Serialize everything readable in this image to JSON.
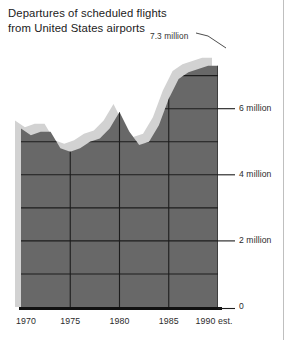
{
  "title": {
    "line1": "Departures of scheduled flights",
    "line2": "from United States airports"
  },
  "annotation": {
    "peak_label": "7.3 million"
  },
  "axes": {
    "y_ticks": [
      {
        "value": 0,
        "label": "0"
      },
      {
        "value": 2,
        "label": "2 million"
      },
      {
        "value": 4,
        "label": "4 million"
      },
      {
        "value": 6,
        "label": "6 million"
      }
    ],
    "x_ticks": [
      {
        "value": 1970,
        "label": "1970"
      },
      {
        "value": 1975,
        "label": "1975"
      },
      {
        "value": 1980,
        "label": "1980"
      },
      {
        "value": 1985,
        "label": "1985"
      },
      {
        "value": 1990,
        "label": "1990 est."
      }
    ]
  },
  "colors": {
    "area_fill": "#686868",
    "area_shadow": "#d2d2d2",
    "gridline": "#1c1c1c",
    "baseline": "#111111",
    "text": "#2b2b2b",
    "page_edge": "#bfbfbf"
  },
  "chart_data": {
    "type": "area",
    "title": "Departures of scheduled flights from United States airports",
    "xlabel": "",
    "ylabel": "Departures",
    "xlim": [
      1970,
      1990
    ],
    "ylim": [
      0,
      7.8
    ],
    "grid": true,
    "legend_position": "none",
    "unit": "million departures",
    "annotations": [
      {
        "text": "7.3 million",
        "x": 1990,
        "y": 7.3
      }
    ],
    "x": [
      1970,
      1971,
      1972,
      1973,
      1974,
      1975,
      1976,
      1977,
      1978,
      1979,
      1980,
      1981,
      1982,
      1983,
      1984,
      1985,
      1986,
      1987,
      1988,
      1989,
      1990
    ],
    "values": [
      5.4,
      5.2,
      5.3,
      5.3,
      4.8,
      4.7,
      4.8,
      5.0,
      5.1,
      5.4,
      5.9,
      5.3,
      4.9,
      5.0,
      5.5,
      6.3,
      6.9,
      7.1,
      7.2,
      7.3,
      7.3
    ],
    "series": [
      {
        "name": "Departures of scheduled flights from United States airports",
        "values": [
          5.4,
          5.2,
          5.3,
          5.3,
          4.8,
          4.7,
          4.8,
          5.0,
          5.1,
          5.4,
          5.9,
          5.3,
          4.9,
          5.0,
          5.5,
          6.3,
          6.9,
          7.1,
          7.2,
          7.3,
          7.3
        ]
      }
    ]
  }
}
